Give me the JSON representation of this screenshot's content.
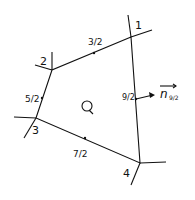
{
  "diagram": {
    "cell_label": "Q",
    "vertices": [
      {
        "id": "1",
        "label": "1",
        "x": 131,
        "y": 37
      },
      {
        "id": "2",
        "label": "2",
        "x": 52,
        "y": 70
      },
      {
        "id": "3",
        "label": "3",
        "x": 36,
        "y": 118
      },
      {
        "id": "4",
        "label": "4",
        "x": 140,
        "y": 163
      }
    ],
    "edges": [
      {
        "from": "1",
        "to": "2",
        "label": "3/2"
      },
      {
        "from": "2",
        "to": "3",
        "label": "5/2"
      },
      {
        "from": "3",
        "to": "4",
        "label": "7/2"
      },
      {
        "from": "4",
        "to": "1",
        "label": "9/2"
      }
    ],
    "normal_vector": {
      "label": "n",
      "subscript": "9/2"
    },
    "colors": {
      "stroke": "#111111",
      "background": "#ffffff"
    }
  }
}
